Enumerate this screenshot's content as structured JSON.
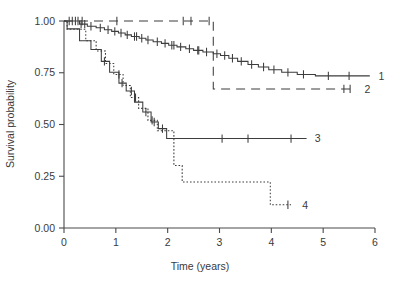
{
  "chart_data": {
    "type": "line",
    "title": "",
    "xlabel": "Time (years)",
    "ylabel": "Survival probability",
    "xlim": [
      0,
      6
    ],
    "ylim": [
      0,
      1
    ],
    "xticks": [
      0,
      1,
      2,
      3,
      4,
      5,
      6
    ],
    "xtick_labels": [
      "0",
      "1",
      "2",
      "3",
      "4",
      "5",
      "6"
    ],
    "yticks": [
      0,
      0.25,
      0.5,
      0.75,
      1.0
    ],
    "ytick_labels": [
      "0.00",
      "0.25",
      "0.50",
      "0.75",
      "1.00"
    ],
    "grid": false,
    "legend_position": "right-inline-end-of-curve",
    "plot_kind": "kaplan-meier-survival",
    "series": [
      {
        "name": "1",
        "label": "1",
        "line_style": "solid",
        "color": "#3d3d3d",
        "end_label_x": 5.95,
        "end_label_y": 0.735,
        "steps": [
          [
            0.0,
            1.0
          ],
          [
            0.3,
            0.985
          ],
          [
            0.45,
            0.975
          ],
          [
            0.62,
            0.967
          ],
          [
            0.78,
            0.958
          ],
          [
            0.92,
            0.95
          ],
          [
            1.05,
            0.942
          ],
          [
            1.18,
            0.933
          ],
          [
            1.3,
            0.925
          ],
          [
            1.45,
            0.917
          ],
          [
            1.58,
            0.908
          ],
          [
            1.72,
            0.9
          ],
          [
            1.88,
            0.892
          ],
          [
            2.02,
            0.883
          ],
          [
            2.18,
            0.875
          ],
          [
            2.35,
            0.866
          ],
          [
            2.5,
            0.858
          ],
          [
            2.68,
            0.85
          ],
          [
            2.88,
            0.842
          ],
          [
            3.02,
            0.833
          ],
          [
            3.18,
            0.82
          ],
          [
            3.35,
            0.805
          ],
          [
            3.55,
            0.79
          ],
          [
            3.75,
            0.778
          ],
          [
            3.95,
            0.765
          ],
          [
            4.2,
            0.752
          ],
          [
            4.5,
            0.742
          ],
          [
            4.85,
            0.735
          ],
          [
            5.9,
            0.735
          ]
        ],
        "censor_marks": [
          0.1,
          0.16,
          0.22,
          0.27,
          0.33,
          0.4,
          0.52,
          0.7,
          0.85,
          0.98,
          1.1,
          1.22,
          1.36,
          1.4,
          1.5,
          1.62,
          1.8,
          1.95,
          2.08,
          2.12,
          2.25,
          2.42,
          2.58,
          2.6,
          2.75,
          2.95,
          3.1,
          3.25,
          3.42,
          3.62,
          3.85,
          4.05,
          4.32,
          4.62,
          5.1,
          5.5
        ]
      },
      {
        "name": "2",
        "label": "2",
        "line_style": "long-dash",
        "color": "#3d3d3d",
        "end_label_x": 5.68,
        "end_label_y": 0.672,
        "steps": [
          [
            0.0,
            1.0
          ],
          [
            2.88,
            1.0
          ],
          [
            2.88,
            0.672
          ],
          [
            5.6,
            0.672
          ]
        ],
        "censor_marks": [
          0.35,
          1.02,
          2.3,
          2.45,
          2.8,
          5.4,
          5.52
        ]
      },
      {
        "name": "3",
        "label": "3",
        "line_style": "solid",
        "color": "#3d3d3d",
        "end_label_x": 4.72,
        "end_label_y": 0.432,
        "steps": [
          [
            0.0,
            1.0
          ],
          [
            0.06,
            0.962
          ],
          [
            0.3,
            0.962
          ],
          [
            0.3,
            0.905
          ],
          [
            0.52,
            0.905
          ],
          [
            0.52,
            0.862
          ],
          [
            0.72,
            0.862
          ],
          [
            0.72,
            0.805
          ],
          [
            0.88,
            0.805
          ],
          [
            0.88,
            0.752
          ],
          [
            1.06,
            0.752
          ],
          [
            1.06,
            0.7
          ],
          [
            1.2,
            0.7
          ],
          [
            1.2,
            0.662
          ],
          [
            1.36,
            0.662
          ],
          [
            1.36,
            0.608
          ],
          [
            1.52,
            0.608
          ],
          [
            1.52,
            0.56
          ],
          [
            1.68,
            0.56
          ],
          [
            1.68,
            0.512
          ],
          [
            1.82,
            0.512
          ],
          [
            1.82,
            0.48
          ],
          [
            1.98,
            0.48
          ],
          [
            1.98,
            0.432
          ],
          [
            4.68,
            0.432
          ]
        ],
        "censor_marks": [
          0.78,
          1.12,
          1.3,
          1.58,
          1.74,
          1.9,
          3.05,
          3.55,
          4.38
        ]
      },
      {
        "name": "4",
        "label": "4",
        "line_style": "dotted",
        "color": "#3d3d3d",
        "end_label_x": 4.48,
        "end_label_y": 0.112,
        "steps": [
          [
            0.0,
            1.0
          ],
          [
            0.06,
            0.96
          ],
          [
            0.42,
            0.96
          ],
          [
            0.42,
            0.905
          ],
          [
            0.62,
            0.905
          ],
          [
            0.62,
            0.855
          ],
          [
            0.8,
            0.855
          ],
          [
            0.8,
            0.795
          ],
          [
            0.96,
            0.795
          ],
          [
            0.96,
            0.742
          ],
          [
            1.14,
            0.742
          ],
          [
            1.14,
            0.688
          ],
          [
            1.28,
            0.688
          ],
          [
            1.28,
            0.63
          ],
          [
            1.44,
            0.63
          ],
          [
            1.44,
            0.578
          ],
          [
            1.62,
            0.578
          ],
          [
            1.62,
            0.52
          ],
          [
            1.8,
            0.52
          ],
          [
            1.8,
            0.47
          ],
          [
            2.12,
            0.47
          ],
          [
            2.12,
            0.302
          ],
          [
            2.28,
            0.302
          ],
          [
            2.28,
            0.222
          ],
          [
            3.98,
            0.222
          ],
          [
            3.98,
            0.112
          ],
          [
            4.38,
            0.112
          ]
        ],
        "censor_marks": [
          1.06,
          1.38,
          1.7,
          4.32
        ]
      }
    ]
  },
  "axes": {
    "x_axis_name": "time-axis",
    "y_axis_name": "survival-probability-axis"
  }
}
